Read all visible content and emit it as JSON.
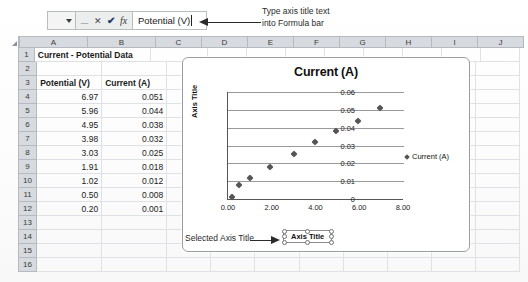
{
  "app": {
    "type": "spreadsheet",
    "formula_bar": {
      "name_box_value": "",
      "value": "Potential (V)",
      "icons": [
        "dropdown-caret-icon",
        "cancel-x-icon",
        "confirm-check-icon",
        "insert-function-fx-icon"
      ],
      "cancel_label": "✕",
      "confirm_label": "✔",
      "fx_label": "fx"
    }
  },
  "annotations": {
    "top": {
      "line1": "Type axis title text",
      "line2": "into Formula bar",
      "arrow": "arrow-left-icon"
    },
    "bottom": {
      "text": "Selected Axis Title",
      "arrow": "arrow-right-icon"
    }
  },
  "sheet": {
    "columns": [
      "A",
      "B",
      "C",
      "D",
      "E",
      "F",
      "G",
      "H",
      "I",
      "J"
    ],
    "column_widths": [
      68,
      68,
      46,
      46,
      46,
      46,
      46,
      46,
      46,
      46
    ],
    "rows": [
      "1",
      "2",
      "3",
      "4",
      "5",
      "6",
      "7",
      "8",
      "9",
      "10",
      "11",
      "12",
      "13",
      "14",
      "15",
      "16"
    ],
    "cells": {
      "A1": "Current - Potential Data",
      "A3": "Potential (V)",
      "B3": "Current (A)",
      "A4": "6.97",
      "B4": "0.051",
      "A5": "5.96",
      "B5": "0.044",
      "A6": "4.95",
      "B6": "0.038",
      "A7": "3.98",
      "B7": "0.032",
      "A8": "3.03",
      "B8": "0.025",
      "A9": "1.91",
      "B9": "0.018",
      "A10": "1.02",
      "B10": "0.012",
      "A11": "0.50",
      "B11": "0.008",
      "A12": "0.20",
      "B12": "0.001"
    }
  },
  "chart": {
    "title": "Current (A)",
    "y_axis_title": "Axis Title",
    "selected_axis_title_text": "Axis Title",
    "legend_entry": "Current (A)"
  },
  "chart_data": {
    "type": "scatter",
    "title": "Current (A)",
    "xlabel": "Axis Title",
    "ylabel": "Axis Title",
    "xlim": [
      0.0,
      8.0
    ],
    "ylim": [
      0.0,
      0.06
    ],
    "xticks": [
      "0.00",
      "2.00",
      "4.00",
      "6.00",
      "8.00"
    ],
    "xtick_values": [
      0.0,
      2.0,
      4.0,
      6.0,
      8.0
    ],
    "yticks": [
      "0",
      "0.01",
      "0.02",
      "0.03",
      "0.04",
      "0.05",
      "0.06"
    ],
    "ytick_values": [
      0,
      0.01,
      0.02,
      0.03,
      0.04,
      0.05,
      0.06
    ],
    "grid": "horizontal",
    "legend": [
      "Current (A)"
    ],
    "legend_position": "right",
    "series": [
      {
        "name": "Current (A)",
        "marker": "diamond",
        "color": "#555555",
        "points": [
          {
            "x": 0.2,
            "y": 0.001
          },
          {
            "x": 0.5,
            "y": 0.008
          },
          {
            "x": 1.02,
            "y": 0.012
          },
          {
            "x": 1.91,
            "y": 0.018
          },
          {
            "x": 3.03,
            "y": 0.025
          },
          {
            "x": 3.98,
            "y": 0.032
          },
          {
            "x": 4.95,
            "y": 0.038
          },
          {
            "x": 5.96,
            "y": 0.044
          },
          {
            "x": 6.97,
            "y": 0.051
          }
        ]
      }
    ]
  },
  "colors": {
    "header_fill": "#d7dade",
    "grid_line": "#dfe1e4",
    "marker": "#555555",
    "chart_border": "#9a9ea3"
  }
}
